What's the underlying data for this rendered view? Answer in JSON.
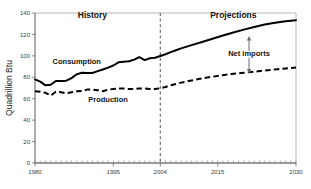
{
  "chart_data": {
    "type": "line",
    "title": "",
    "xlabel": "",
    "ylabel": "Quadrillion Btu",
    "xlim": [
      1980,
      2030
    ],
    "ylim": [
      0,
      140
    ],
    "grid": false,
    "legend": "inline-labels",
    "ytick_labels": [
      "0",
      "20",
      "40",
      "60",
      "80",
      "100",
      "120",
      "140"
    ],
    "ytick_values": [
      0,
      20,
      40,
      60,
      80,
      100,
      120,
      140
    ],
    "xtick_labels": [
      "1980",
      "1995",
      "2004",
      "2015",
      "2030"
    ],
    "xtick_values": [
      1980,
      1995,
      2004,
      2015,
      2030
    ],
    "annotations": [
      {
        "name": "history",
        "text": "History",
        "x": 1991,
        "y": 135
      },
      {
        "name": "projections",
        "text": "Projections",
        "x": 2018,
        "y": 135
      },
      {
        "name": "consumption",
        "text": "Consumption",
        "x": 1988,
        "y": 92
      },
      {
        "name": "production",
        "text": "Production",
        "x": 1994,
        "y": 57
      },
      {
        "name": "net-imports",
        "text": "Net imports",
        "x": 2021,
        "y": 100
      }
    ],
    "divider": {
      "x": 2004,
      "label": "History / Projections boundary",
      "style": "dashed"
    },
    "net_imports_arrow": {
      "x": 2021,
      "y_top": 118,
      "y_bottom": 84
    },
    "series": [
      {
        "name": "Consumption",
        "style": "solid",
        "x": [
          1980,
          1981,
          1982,
          1983,
          1984,
          1985,
          1986,
          1987,
          1988,
          1989,
          1990,
          1991,
          1992,
          1993,
          1994,
          1995,
          1996,
          1997,
          1998,
          1999,
          2000,
          2001,
          2002,
          2003,
          2004,
          2005,
          2006,
          2007,
          2008,
          2010,
          2012,
          2014,
          2016,
          2018,
          2020,
          2022,
          2024,
          2026,
          2028,
          2030
        ],
        "values": [
          78,
          76,
          72.5,
          73,
          76.5,
          76.5,
          76.8,
          79.2,
          82.8,
          84.2,
          84.1,
          84.0,
          85.7,
          87.3,
          89.0,
          91.0,
          94.0,
          94.5,
          95.0,
          96.5,
          98.9,
          96.0,
          97.8,
          98.2,
          99.8,
          101.5,
          103.5,
          105.2,
          107.0,
          110.0,
          113.0,
          116.0,
          119.0,
          121.8,
          124.5,
          127.0,
          129.3,
          131.0,
          132.3,
          133.3
        ],
        "units": "Quadrillion Btu"
      },
      {
        "name": "Production",
        "style": "dashed",
        "x": [
          1980,
          1981,
          1982,
          1983,
          1984,
          1985,
          1986,
          1987,
          1988,
          1989,
          1990,
          1991,
          1992,
          1993,
          1994,
          1995,
          1996,
          1997,
          1998,
          1999,
          2000,
          2001,
          2002,
          2003,
          2004,
          2005,
          2006,
          2007,
          2008,
          2010,
          2012,
          2014,
          2016,
          2018,
          2020,
          2022,
          2024,
          2026,
          2028,
          2030
        ],
        "values": [
          67.0,
          66.5,
          65.5,
          63.0,
          66.5,
          66.0,
          65.0,
          66.0,
          67.0,
          67.3,
          68.5,
          68.5,
          68.0,
          67.0,
          68.5,
          69.0,
          69.5,
          69.5,
          69.0,
          69.0,
          69.5,
          69.5,
          69.0,
          69.0,
          69.8,
          71.0,
          72.5,
          73.8,
          75.0,
          77.0,
          79.0,
          80.5,
          82.0,
          83.2,
          84.2,
          85.2,
          86.3,
          87.3,
          88.3,
          89.2
        ],
        "units": "Quadrillion Btu"
      }
    ]
  }
}
